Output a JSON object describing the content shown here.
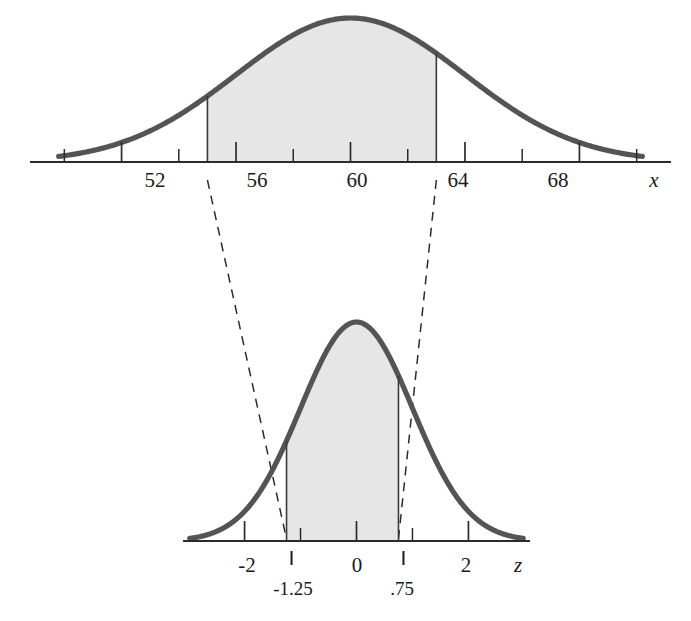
{
  "figure": {
    "kind": "normal-distribution-standardization-diagram",
    "colors": {
      "curve": "#545454",
      "shade_fill": "#e6e6e6",
      "axis": "#2b2b2b",
      "boundary_line": "#3a3a3a",
      "dashed_connector": "#2b2b2b",
      "text": "#1a1a1a",
      "background": "#ffffff"
    }
  },
  "chart_data": {
    "type": "area",
    "title": "",
    "subtitle": "",
    "panels": [
      {
        "id": "top-panel",
        "name": "x-distribution",
        "curve": "normal",
        "xlabel": "x",
        "ylabel": "",
        "mean": 60,
        "sd": 4,
        "xlim": [
          48.8,
          71.2
        ],
        "grid": false,
        "legend": null,
        "tick_labels": [
          "52",
          "56",
          "60",
          "64",
          "68"
        ],
        "tick_values": [
          52,
          56,
          60,
          64,
          68
        ],
        "minor_tick_values": [
          50,
          54,
          58,
          62,
          66,
          70
        ],
        "shaded_region": {
          "from": 55,
          "to": 63,
          "from_label": "",
          "to_label": "",
          "fill": "#e6e6e6"
        }
      },
      {
        "id": "bottom-panel",
        "name": "z-distribution",
        "curve": "standard-normal",
        "xlabel": "z",
        "ylabel": "",
        "mean": 0,
        "sd": 1,
        "xlim": [
          -3.1,
          3.1
        ],
        "grid": false,
        "legend": null,
        "tick_labels": [
          "-2",
          "0",
          "2"
        ],
        "tick_values": [
          -2,
          0,
          2
        ],
        "minor_tick_values": [
          -1,
          1
        ],
        "shaded_region": {
          "from": -1.25,
          "to": 0.75,
          "from_label": "-1.25",
          "to_label": ".75",
          "fill": "#e6e6e6"
        }
      }
    ],
    "connectors": [
      {
        "from_panel": "top-panel",
        "from_value": 55,
        "to_panel": "bottom-panel",
        "to_value": -1.25,
        "style": "dashed"
      },
      {
        "from_panel": "top-panel",
        "from_value": 63,
        "to_panel": "bottom-panel",
        "to_value": 0.75,
        "style": "dashed"
      }
    ],
    "annotations": [
      {
        "text": "x",
        "role": "axis-variable-top",
        "italic": true
      },
      {
        "text": "z",
        "role": "axis-variable-bottom",
        "italic": true
      },
      {
        "text": "-1.25",
        "role": "z-lower-bound"
      },
      {
        "text": ".75",
        "role": "z-upper-bound"
      }
    ]
  },
  "top_axis": {
    "variable": "x",
    "labels": [
      {
        "text": "52",
        "value": 52
      },
      {
        "text": "56",
        "value": 56
      },
      {
        "text": "60",
        "value": 60
      },
      {
        "text": "64",
        "value": 64
      },
      {
        "text": "68",
        "value": 68
      }
    ]
  },
  "bottom_axis": {
    "variable": "z",
    "labels": [
      {
        "text": "-2",
        "value": -2
      },
      {
        "text": "0",
        "value": 0
      },
      {
        "text": "2",
        "value": 2
      }
    ],
    "bound_labels": [
      {
        "text": "-1.25",
        "value": -1.25
      },
      {
        "text": ".75",
        "value": 0.75
      }
    ]
  }
}
